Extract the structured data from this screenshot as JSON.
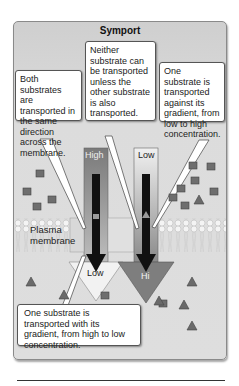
{
  "title": "Symport",
  "callouts": {
    "left": "Both substrates are transported in the same direction across the membrane.",
    "middle": "Neither substrate can be transported unless the other substrate is also transported.",
    "right": "One substrate is transported against its gradient, from low to high concentration.",
    "bottom": "One substrate is transported with its gradient, from high to low concentration."
  },
  "membrane_label": "Plasma membrane",
  "gradients": {
    "left": {
      "top": "High",
      "bottom": "Low"
    },
    "right": {
      "top": "Low",
      "bottom": "Hi"
    }
  },
  "colors": {
    "panel": "#d9d9d9",
    "high_bar": "#8c8c8c",
    "low_bar": "#e6e6e6",
    "arrow": "#111111",
    "particle": "#6e6e6e"
  }
}
